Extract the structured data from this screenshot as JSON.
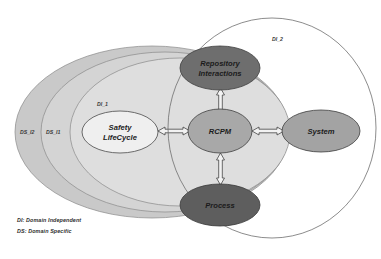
{
  "diagram": {
    "environments": [
      {
        "id": "ds_i2",
        "label": "DS_I2",
        "fill": "#c9c9c9",
        "stroke": "#8a8a8a"
      },
      {
        "id": "ds_i1",
        "label": "DS_I1",
        "fill": "#d4d4d4",
        "stroke": "#8a8a8a"
      },
      {
        "id": "di_1",
        "label": "DI_1",
        "fill": "#dedede",
        "stroke": "#8a8a8a"
      },
      {
        "id": "di_2",
        "label": "DI_2",
        "fill": "none",
        "stroke": "#6f6f6f"
      }
    ],
    "nodes": [
      {
        "id": "repository-interactions",
        "label_line1": "Repository",
        "label_line2": "Interactions",
        "fill": "#6e6e6e",
        "stroke": "#3d3d3d",
        "text_tone": "dark"
      },
      {
        "id": "safety-lifecycle",
        "label_line1": "Safety",
        "label_line2": "LifeCycle",
        "fill": "#efefef",
        "stroke": "#4a4a4a",
        "text_tone": "dark"
      },
      {
        "id": "rcpm",
        "label_line1": "RCPM",
        "label_line2": "",
        "fill": "#a8a8a8",
        "stroke": "#3d3d3d",
        "text_tone": "dark"
      },
      {
        "id": "system",
        "label_line1": "System",
        "label_line2": "",
        "fill": "#a3a3a3",
        "stroke": "#3d3d3d",
        "text_tone": "dark"
      },
      {
        "id": "process",
        "label_line1": "Process",
        "label_line2": "",
        "fill": "#5e5e5e",
        "stroke": "#3a3a3a",
        "text_tone": "dark"
      }
    ],
    "connectors": [
      {
        "id": "rcpm-repository-interactions",
        "from": "rcpm",
        "to": "repository-interactions",
        "style": "double-headed-arrow"
      },
      {
        "id": "rcpm-process",
        "from": "rcpm",
        "to": "process",
        "style": "double-headed-arrow"
      },
      {
        "id": "rcpm-safety-lifecycle",
        "from": "rcpm",
        "to": "safety-lifecycle",
        "style": "double-headed-arrow"
      },
      {
        "id": "rcpm-system",
        "from": "rcpm",
        "to": "system",
        "style": "double-headed-arrow"
      }
    ],
    "legend": {
      "di": "DI: Domain Independent",
      "ds": "DS: Domain Specific"
    },
    "colors": {
      "arrow_fill": "#f2f2f2",
      "arrow_stroke": "#3c3c3c",
      "background": "#ffffff"
    }
  }
}
